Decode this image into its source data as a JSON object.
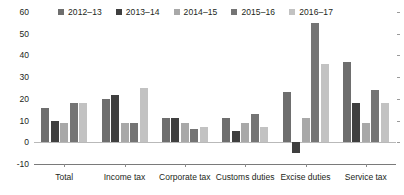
{
  "chart_data": {
    "type": "bar",
    "title": "",
    "subtitle": "",
    "xlabel": "",
    "ylabel": "",
    "ylim": [
      -10,
      60
    ],
    "yticks": [
      -10,
      0,
      10,
      20,
      30,
      40,
      50,
      60
    ],
    "ytick_labels": [
      "-10",
      "0",
      "10",
      "20",
      "30",
      "40",
      "50",
      "60"
    ],
    "grid": false,
    "legend_position": "top",
    "categories": [
      "Total",
      "Income tax",
      "Corporate tax",
      "Customs duties",
      "Excise duties",
      "Service tax"
    ],
    "series": [
      {
        "name": "2012–13",
        "color": "#6e6e6e",
        "values": [
          16,
          20,
          11,
          11,
          23,
          37
        ]
      },
      {
        "name": "2013–14",
        "color": "#3f3f3f",
        "values": [
          10,
          22,
          11,
          5,
          -5,
          18
        ]
      },
      {
        "name": "2014–15",
        "color": "#a8a8a8",
        "values": [
          9,
          9,
          9,
          9,
          11,
          9
        ]
      },
      {
        "name": "2015–16",
        "color": "#747474",
        "values": [
          18,
          9,
          6,
          13,
          55,
          24
        ]
      },
      {
        "name": "2016–17",
        "color": "#c2c2c2",
        "values": [
          18,
          25,
          7,
          7,
          36,
          18
        ]
      }
    ]
  },
  "legend": {
    "items": [
      {
        "label": "2012–13"
      },
      {
        "label": "2013–14"
      },
      {
        "label": "2014–15"
      },
      {
        "label": "2015–16"
      },
      {
        "label": "2016–17"
      }
    ]
  },
  "axis": {
    "y_labels": [
      "60",
      "50",
      "40",
      "30",
      "20",
      "10",
      "0",
      "-10"
    ],
    "x_labels": [
      "Total",
      "Income tax",
      "Corporate tax",
      "Customs duties",
      "Excise duties",
      "Service tax"
    ]
  },
  "colors": {
    "series_1": "#6e6e6e",
    "series_2": "#3f3f3f",
    "series_3": "#a8a8a8",
    "series_4": "#747474",
    "series_5": "#c2c2c2",
    "axis": "#7a7a7a",
    "text": "#231f20"
  }
}
